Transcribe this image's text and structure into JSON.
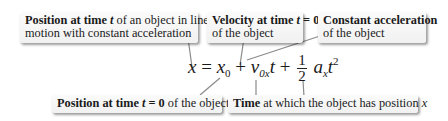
{
  "equation": {
    "lhs": "x",
    "equals": "=",
    "x0_base": "x",
    "x0_sub": "0",
    "plus1": "+",
    "v_base": "v",
    "v_sub": "0x",
    "t1": "t",
    "plus2": "+",
    "frac_num": "1",
    "frac_den": "2",
    "a_base": "a",
    "a_sub": "x",
    "t2": "t",
    "t2_sup": "2"
  },
  "callouts": {
    "position_t": {
      "bold": "Position at time ",
      "var": "t",
      "rest": " of an object in linear",
      "line2": "motion with constant acceleration"
    },
    "velocity_0": {
      "bold": "Velocity at time ",
      "var": "t",
      "bold2": " = 0",
      "line2": "of the object"
    },
    "accel": {
      "bold": "Constant acceleration",
      "line2": "of the object"
    },
    "position_0": {
      "bold": "Position at time ",
      "var": "t",
      "bold2": " = 0",
      "rest": " of the object"
    },
    "time": {
      "bold": "Time",
      "rest": " at which the object has position ",
      "var": "x"
    }
  },
  "colors": {
    "box_bg": "#f3f3f3",
    "line": "#8a8a8a",
    "text": "#1a1a1a"
  }
}
